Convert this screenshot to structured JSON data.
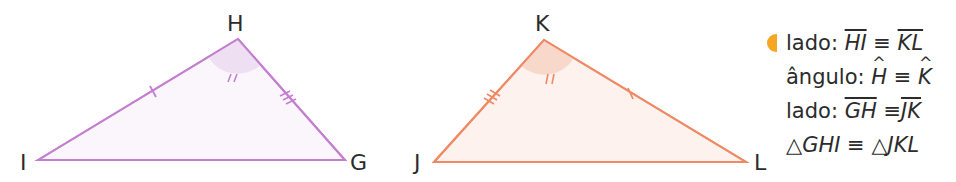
{
  "triangle1": {
    "vertices": {
      "I": [
        38,
        160
      ],
      "H": [
        238,
        39
      ],
      "G": [
        345,
        160
      ]
    },
    "labels": {
      "H": "H",
      "I": "I",
      "G": "G"
    },
    "stroke": "#c47fd0",
    "fill": "#fbf6fc",
    "angle_fill": "#efdff3"
  },
  "triangle2": {
    "vertices": {
      "J": [
        434,
        162
      ],
      "K": [
        544,
        40
      ],
      "L": [
        746,
        162
      ]
    },
    "labels": {
      "K": "K",
      "J": "J",
      "L": "L"
    },
    "stroke": "#ef8a64",
    "fill": "#fdf2ee",
    "angle_fill": "#f9d8cc"
  },
  "statements": [
    {
      "prefix": "lado: ",
      "left": "HI",
      "op": "≡",
      "right": "KL",
      "type": "segment"
    },
    {
      "prefix": "ângulo: ",
      "left": "H",
      "op": "≡",
      "right": "K",
      "type": "angle"
    },
    {
      "prefix": "lado: ",
      "left": "GH",
      "op": "≡",
      "right": "JK",
      "type": "segment"
    },
    {
      "prefix": "",
      "left": "△GHI",
      "op": "≡",
      "right": "△JKL",
      "type": "triangle"
    }
  ],
  "bullet_color": "#f5a623"
}
